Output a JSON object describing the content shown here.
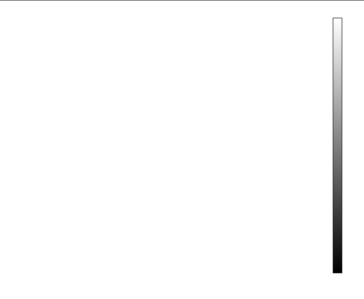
{
  "chart_data": {
    "type": "surface3d",
    "function": "peaks",
    "title": "",
    "xlabel": "x",
    "ylabel": "y",
    "zlabel": "z",
    "xlim": [
      -4,
      4
    ],
    "ylim": [
      -4,
      4
    ],
    "zlim": [
      -10,
      10
    ],
    "x_ticks": [
      -4,
      -2,
      0,
      2,
      4
    ],
    "y_ticks": [
      -4,
      -2,
      0,
      2,
      4
    ],
    "z_ticks": [
      -10,
      -5,
      0,
      5,
      10
    ],
    "x_tick_labels": [
      "-4",
      "-2",
      "0",
      "2",
      "4"
    ],
    "y_tick_labels": [
      "-4",
      "-2",
      "0",
      "2",
      "4"
    ],
    "z_tick_labels": [
      "-10",
      "-5",
      "0",
      "5",
      "10"
    ],
    "domain": [
      -3,
      3
    ],
    "grid": true,
    "colormap": "gray",
    "colorbar": {
      "position": "right",
      "range": [
        -6.55,
        8.1
      ],
      "ticks": [
        8,
        6,
        4,
        2,
        0,
        -2,
        -4,
        -6
      ],
      "tick_labels": [
        "8",
        "6",
        "4",
        "2",
        "0",
        "-2",
        "-4",
        "-6"
      ]
    },
    "features": [
      {
        "name": "main peak",
        "x": -0.0,
        "y": 1.6,
        "z": 8.1
      },
      {
        "name": "secondary peak",
        "x": -0.5,
        "y": -0.6,
        "z": 3.8
      },
      {
        "name": "right ridge",
        "x": 1.3,
        "y": 0.2,
        "z": 3.5
      },
      {
        "name": "trough",
        "x": 0.2,
        "y": -1.6,
        "z": -6.55
      },
      {
        "name": "left dip",
        "x": -1.4,
        "y": 0.2,
        "z": -3.0
      }
    ]
  },
  "labels": {
    "x": "x",
    "y": "y",
    "z": "z"
  }
}
